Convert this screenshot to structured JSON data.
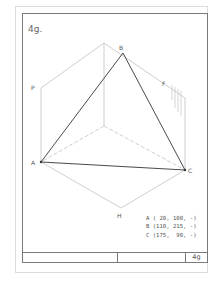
{
  "sheet": {
    "title": "4g.",
    "title_block": {
      "cells": [
        "",
        "",
        "4g"
      ]
    }
  },
  "diagram": {
    "labels": {
      "P": "P",
      "B": "B",
      "F": "F",
      "A": "A",
      "C": "C",
      "H": "H"
    },
    "points": {
      "A": [
        41,
        162
      ],
      "B": [
        123,
        53
      ],
      "C": [
        185,
        170
      ],
      "P": [
        41,
        88
      ],
      "top": [
        104,
        43
      ],
      "F_corner": [
        185,
        98
      ],
      "H": [
        121,
        208
      ],
      "center": [
        104,
        126
      ]
    },
    "colors": {
      "triangle": "#4a4a4a",
      "construction": "#c8c8c8",
      "frame": "#7a7a7a",
      "outer_frame": "#d8d8d8"
    }
  },
  "coordinates": [
    "A ( 20, 100, -)",
    "B (110, 215, -)",
    "C (175,  90, -)"
  ]
}
